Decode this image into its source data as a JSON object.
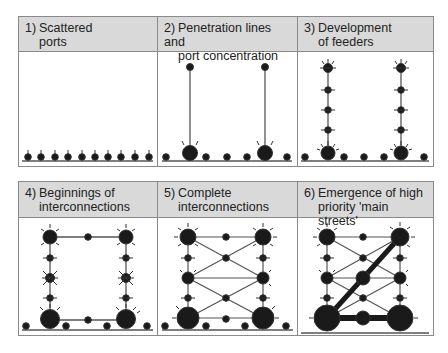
{
  "figure": {
    "panels": [
      {
        "id": 1,
        "number": "1)",
        "line1": "Scattered",
        "line2": "ports"
      },
      {
        "id": 2,
        "number": "2)",
        "line1": "Penetration lines and",
        "line2": "port concentration"
      },
      {
        "id": 3,
        "number": "3)",
        "line1": "Development",
        "line2": "of feeders"
      },
      {
        "id": 4,
        "number": "4)",
        "line1": "Beginnings of",
        "line2": "interconnections"
      },
      {
        "id": 5,
        "number": "5)",
        "line1": "Complete",
        "line2": "interconnections"
      },
      {
        "id": 6,
        "number": "6)",
        "line1": "Emergence of high",
        "line2": "priority 'main streets'"
      }
    ],
    "colors": {
      "header_bg": "#d9d9d9",
      "border": "#8a8a8a",
      "node": "#1a1a1a",
      "line": "#555555"
    }
  }
}
